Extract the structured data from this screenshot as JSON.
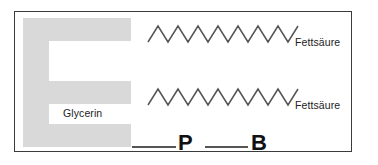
{
  "diagram": {
    "backbone": {
      "label": "Glycerin",
      "shape_name": "E-shaped glycerin backbone",
      "color": "#d9d9d9"
    },
    "chains": [
      {
        "label": "Fettsäure",
        "peaks": 8,
        "color": "#555555"
      },
      {
        "label": "Fettsäure",
        "peaks": 8,
        "color": "#555555"
      }
    ],
    "tail": {
      "phosphate_label": "P",
      "base_label": "B",
      "connector_color": "#555555",
      "letter_color": "#111111"
    },
    "frame": {
      "border_color": "#3b3b3b",
      "background_color": "#ffffff"
    }
  }
}
